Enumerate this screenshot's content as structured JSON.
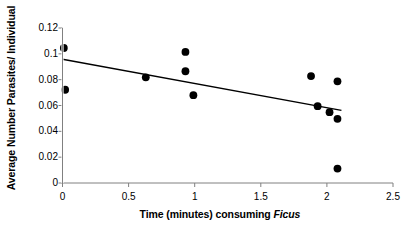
{
  "chart_data": {
    "type": "scatter",
    "title": "",
    "xlabel": "Time (minutes) consuming Ficus",
    "xlabel_plain": "Time (minutes) consuming ",
    "xlabel_italic": "Ficus",
    "ylabel": "Average Number Parasites/ Individual",
    "xlim": [
      0,
      2.5
    ],
    "ylim": [
      0,
      0.12
    ],
    "xticks": [
      0,
      0.5,
      1,
      1.5,
      2,
      2.5
    ],
    "xtick_labels": [
      "0",
      "0.5",
      "1",
      "1.5",
      "2",
      "2.5"
    ],
    "yticks": [
      0,
      0.02,
      0.04,
      0.06,
      0.08,
      0.1,
      0.12
    ],
    "ytick_labels": [
      "0",
      "0.02",
      "0.04",
      "0.06",
      "0.08",
      "0.1",
      "0.12"
    ],
    "grid": false,
    "legend": false,
    "marker": "filled-circle",
    "marker_color": "#000000",
    "marker_size": 5.2,
    "points": [
      {
        "x": 0.01,
        "y": 0.1045
      },
      {
        "x": 0.02,
        "y": 0.0722
      },
      {
        "x": 0.63,
        "y": 0.0818
      },
      {
        "x": 0.93,
        "y": 0.1015
      },
      {
        "x": 0.93,
        "y": 0.0865
      },
      {
        "x": 0.99,
        "y": 0.068
      },
      {
        "x": 1.88,
        "y": 0.0828
      },
      {
        "x": 1.93,
        "y": 0.0595
      },
      {
        "x": 2.02,
        "y": 0.0548
      },
      {
        "x": 2.08,
        "y": 0.0787
      },
      {
        "x": 2.08,
        "y": 0.0497
      },
      {
        "x": 2.08,
        "y": 0.0112
      }
    ],
    "trendline": {
      "type": "linear",
      "x_start": 0.0,
      "y_start": 0.0958,
      "x_end": 2.11,
      "y_end": 0.0562,
      "color": "#000000",
      "width": 1.4
    },
    "axis_color": "#808080",
    "text_color": "#000000"
  }
}
